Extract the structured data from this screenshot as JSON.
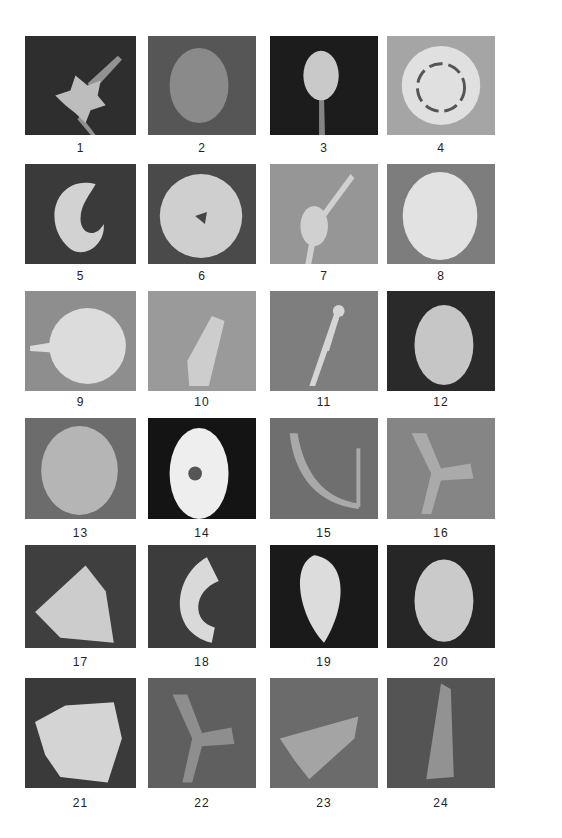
{
  "header": {
    "text": ""
  },
  "plate": {
    "panels": [
      {
        "n": "1",
        "bg": "#2e2e2e",
        "fg": "#bdbdbd",
        "shape": "star-spike"
      },
      {
        "n": "2",
        "bg": "#565656",
        "fg": "#8a8a8a",
        "shape": "oval"
      },
      {
        "n": "3",
        "bg": "#1c1c1c",
        "fg": "#c9c9c9",
        "shape": "cluster"
      },
      {
        "n": "4",
        "bg": "#a5a5a5",
        "fg": "#e0e0e0",
        "shape": "rosette"
      },
      {
        "n": "5",
        "bg": "#3a3a3a",
        "fg": "#d2d2d2",
        "shape": "crescent"
      },
      {
        "n": "6",
        "bg": "#4a4a4a",
        "fg": "#cfcfcf",
        "shape": "sphere"
      },
      {
        "n": "7",
        "bg": "#969696",
        "fg": "#d0d0d0",
        "shape": "spindle"
      },
      {
        "n": "8",
        "bg": "#7d7d7d",
        "fg": "#e2e2e2",
        "shape": "disc"
      },
      {
        "n": "9",
        "bg": "#8e8e8e",
        "fg": "#dcdcdc",
        "shape": "rough-blob"
      },
      {
        "n": "10",
        "bg": "#9a9a9a",
        "fg": "#cdcdcd",
        "shape": "elongate"
      },
      {
        "n": "11",
        "bg": "#7e7e7e",
        "fg": "#d5d5d5",
        "shape": "twig"
      },
      {
        "n": "12",
        "bg": "#2a2a2a",
        "fg": "#c6c6c6",
        "shape": "egg"
      },
      {
        "n": "13",
        "bg": "#6c6c6c",
        "fg": "#b5b5b5",
        "shape": "disc"
      },
      {
        "n": "14",
        "bg": "#141414",
        "fg": "#eeeeee",
        "shape": "halo"
      },
      {
        "n": "15",
        "bg": "#6f6f6f",
        "fg": "#a9a9a9",
        "shape": "u-branch"
      },
      {
        "n": "16",
        "bg": "#858585",
        "fg": "#aaaaaa",
        "shape": "tri-arm"
      },
      {
        "n": "17",
        "bg": "#3f3f3f",
        "fg": "#cccccc",
        "shape": "triangle"
      },
      {
        "n": "18",
        "bg": "#3c3c3c",
        "fg": "#d9d9d9",
        "shape": "c-shape"
      },
      {
        "n": "19",
        "bg": "#1a1a1a",
        "fg": "#dcdcdc",
        "shape": "teardrop"
      },
      {
        "n": "20",
        "bg": "#262626",
        "fg": "#cacaca",
        "shape": "egg"
      },
      {
        "n": "21",
        "bg": "#3a3a3a",
        "fg": "#d4d4d4",
        "shape": "chunk"
      },
      {
        "n": "22",
        "bg": "#5f5f5f",
        "fg": "#8e8e8e",
        "shape": "tri-arm"
      },
      {
        "n": "23",
        "bg": "#6b6b6b",
        "fg": "#a4a4a4",
        "shape": "wedge"
      },
      {
        "n": "24",
        "bg": "#545454",
        "fg": "#929292",
        "shape": "cone"
      }
    ]
  }
}
